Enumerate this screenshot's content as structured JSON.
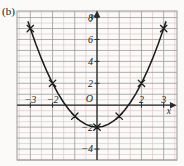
{
  "figure": {
    "panel_label": "(b)",
    "background_color": "#fbfaf8",
    "grid_major_color": "#9a9a9e",
    "grid_minor_color": "#d8c2c2",
    "axis_color": "#2b2b2b",
    "curve_color": "#1a1a1a",
    "marker_color": "#1a1a1a"
  },
  "chart_data": {
    "type": "line",
    "title": "",
    "subtitle": "",
    "xlabel": "x",
    "ylabel": "y",
    "origin_label": "O",
    "xlim": [
      -3.6,
      3.6
    ],
    "ylim": [
      -5.0,
      8.6
    ],
    "grid": true,
    "grid_major_step": 1,
    "grid_minor_step": 0.5,
    "legend": "none",
    "annotations": [],
    "xticks": [
      -3,
      -2,
      2,
      3
    ],
    "xtick_labels": [
      "−3",
      "−2",
      "2",
      "3"
    ],
    "yticks": [
      8,
      6,
      4,
      2,
      -2,
      -4
    ],
    "ytick_labels": [
      "8",
      "6",
      "4",
      "2",
      "−2",
      "−4"
    ],
    "equation": "y = x² − 2",
    "series": [
      {
        "name": "y = x² − 2",
        "marker": "x",
        "x": [
          -3,
          -2,
          -1,
          0,
          1,
          2,
          3
        ],
        "values": [
          7,
          2,
          -1,
          -2,
          -1,
          2,
          7
        ]
      }
    ],
    "curve_x": [
      -3.1,
      -3.0,
      -2.75,
      -2.5,
      -2.25,
      -2.0,
      -1.75,
      -1.5,
      -1.25,
      -1.0,
      -0.75,
      -0.5,
      -0.25,
      0,
      0.25,
      0.5,
      0.75,
      1.0,
      1.25,
      1.5,
      1.75,
      2.0,
      2.25,
      2.5,
      2.75,
      3.0,
      3.1
    ],
    "curve_y": [
      7.61,
      7.0,
      5.5625,
      4.25,
      3.0625,
      2.0,
      1.0625,
      0.25,
      -0.4375,
      -1.0,
      -1.4375,
      -1.75,
      -1.9375,
      -2,
      -1.9375,
      -1.75,
      -1.4375,
      -1.0,
      -0.4375,
      0.25,
      1.0625,
      2.0,
      3.0625,
      4.25,
      5.5625,
      7.0,
      7.61
    ]
  }
}
